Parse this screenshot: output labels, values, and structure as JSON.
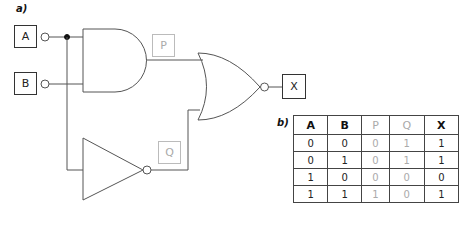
{
  "labels": {
    "part_a": "a)",
    "part_b": "b)"
  },
  "inputs": [
    {
      "name": "A"
    },
    {
      "name": "B"
    }
  ],
  "intermediates": [
    {
      "name": "P"
    },
    {
      "name": "Q"
    }
  ],
  "output": {
    "name": "X"
  },
  "gates": [
    {
      "type": "AND",
      "inputs": [
        "A",
        "B"
      ],
      "output": "P"
    },
    {
      "type": "NOT",
      "inputs": [
        "A"
      ],
      "output": "Q"
    },
    {
      "type": "NOR",
      "inputs": [
        "P",
        "Q"
      ],
      "output": "X"
    }
  ],
  "truth_table": {
    "headers": [
      "A",
      "B",
      "P",
      "Q",
      "X"
    ],
    "rows": [
      [
        "0",
        "0",
        "0",
        "1",
        "1"
      ],
      [
        "0",
        "1",
        "0",
        "1",
        "1"
      ],
      [
        "1",
        "0",
        "0",
        "0",
        "0"
      ],
      [
        "1",
        "1",
        "1",
        "0",
        "1"
      ]
    ]
  },
  "colors": {
    "line": "#555555",
    "faint": "#aaaaaa",
    "text": "#222222"
  }
}
